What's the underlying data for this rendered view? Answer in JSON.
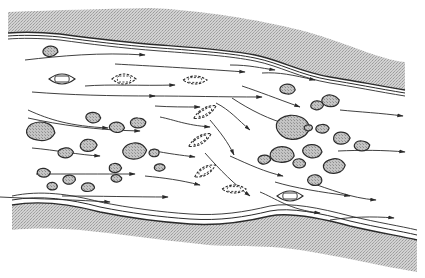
{
  "diagram": {
    "elements": {
      "banks": [
        "top-bank",
        "bottom-bank"
      ],
      "flow_arrows_count": 28,
      "rocks_count": 30,
      "boats": [
        {
          "style": "solid"
        },
        {
          "style": "dashed"
        },
        {
          "style": "dashed"
        },
        {
          "style": "dashed"
        },
        {
          "style": "dashed"
        },
        {
          "style": "dashed"
        },
        {
          "style": "dashed"
        },
        {
          "style": "solid"
        }
      ]
    },
    "colors": {
      "bank_fill": "#c8c8c8",
      "rock_fill": "#bdbdbd",
      "line": "#2a2a2a",
      "background": "#ffffff"
    }
  }
}
